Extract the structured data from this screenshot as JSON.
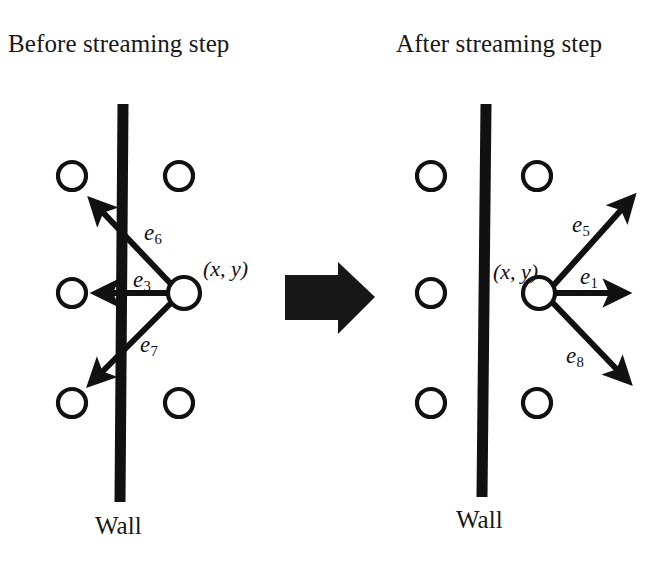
{
  "figure": {
    "background_color": "#ffffff",
    "ink_color": "#111111",
    "width": 670,
    "height": 566
  },
  "panels": {
    "left": {
      "title": "Before streaming step",
      "wall_label": "Wall",
      "node_label": "(x, y)",
      "vectors": [
        {
          "id": "e6",
          "base": "e",
          "sub": "6",
          "label": "e6",
          "direction": "up-left",
          "from": [
            171,
            284
          ],
          "to": [
            87,
            196
          ]
        },
        {
          "id": "e3",
          "base": "e",
          "sub": "3",
          "label": "e3",
          "direction": "left",
          "from": [
            171,
            293
          ],
          "to": [
            90,
            293
          ]
        },
        {
          "id": "e7",
          "base": "e",
          "sub": "7",
          "label": "e7",
          "direction": "down-left",
          "from": [
            171,
            303
          ],
          "to": [
            85,
            389
          ]
        }
      ],
      "lattice_nodes": [
        {
          "x": 72,
          "y": 176,
          "r": 14
        },
        {
          "x": 179,
          "y": 176,
          "r": 14
        },
        {
          "x": 72,
          "y": 293,
          "r": 14
        },
        {
          "x": 184,
          "y": 293,
          "r": 16
        },
        {
          "x": 72,
          "y": 403,
          "r": 14
        },
        {
          "x": 179,
          "y": 403,
          "r": 14
        }
      ],
      "wall": {
        "x_top": 123,
        "x_bottom": 120,
        "y_top": 104,
        "y_bottom": 502,
        "thickness": 11
      }
    },
    "right": {
      "title": "After streaming step",
      "wall_label": "Wall",
      "node_label": "(x, y)",
      "vectors": [
        {
          "id": "e5",
          "base": "e",
          "sub": "5",
          "label": "e5",
          "direction": "up-right",
          "from": [
            552,
            287
          ],
          "to": [
            637,
            193
          ]
        },
        {
          "id": "e1",
          "base": "e",
          "sub": "1",
          "label": "e1",
          "direction": "right",
          "from": [
            554,
            293
          ],
          "to": [
            631,
            293
          ]
        },
        {
          "id": "e8",
          "base": "e",
          "sub": "8",
          "label": "e8",
          "direction": "down-right",
          "from": [
            552,
            302
          ],
          "to": [
            633,
            386
          ]
        }
      ],
      "lattice_nodes": [
        {
          "x": 431,
          "y": 176,
          "r": 14
        },
        {
          "x": 537,
          "y": 176,
          "r": 14
        },
        {
          "x": 431,
          "y": 293,
          "r": 14
        },
        {
          "x": 539,
          "y": 293,
          "r": 16
        },
        {
          "x": 431,
          "y": 403,
          "r": 14
        },
        {
          "x": 537,
          "y": 403,
          "r": 14
        }
      ],
      "wall": {
        "x_top": 486,
        "x_bottom": 482,
        "y_top": 104,
        "y_bottom": 497,
        "thickness": 11
      }
    }
  },
  "transition_arrow": {
    "name": "streaming-step-arrow",
    "direction": "right",
    "color": "#171717"
  },
  "label_positions": {
    "left_e6": {
      "left": 144,
      "top": 221
    },
    "left_e3": {
      "left": 133,
      "top": 268
    },
    "left_e7": {
      "left": 140,
      "top": 333
    },
    "left_xy": {
      "left": 203,
      "top": 256
    },
    "right_e5": {
      "left": 572,
      "top": 213
    },
    "right_e1": {
      "left": 580,
      "top": 265
    },
    "right_e8": {
      "left": 566,
      "top": 344
    },
    "right_xy": {
      "left": 493,
      "top": 259
    }
  }
}
